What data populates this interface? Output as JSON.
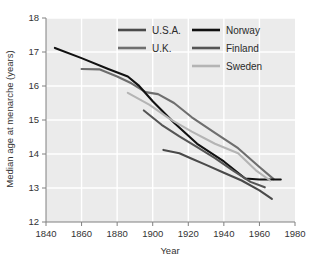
{
  "chart_data": {
    "type": "line",
    "title": "",
    "xlabel": "Year",
    "ylabel": "Median age at menarche (years)",
    "xlim": [
      1840,
      1980
    ],
    "ylim": [
      12,
      18
    ],
    "xticks": [
      1840,
      1860,
      1880,
      1900,
      1920,
      1940,
      1960,
      1980
    ],
    "yticks": [
      12,
      13,
      14,
      15,
      16,
      17,
      18
    ],
    "grid": true,
    "legend_position": "top-right",
    "series": [
      {
        "name": "U.S.A.",
        "color": "#4a4a4a",
        "x": [
          1906,
          1915,
          1922,
          1930,
          1940,
          1950,
          1960,
          1967
        ],
        "y": [
          14.12,
          14.02,
          13.86,
          13.68,
          13.45,
          13.22,
          12.93,
          12.68
        ]
      },
      {
        "name": "U.K.",
        "color": "#6e6e6e",
        "x": [
          1860,
          1870,
          1880,
          1888,
          1896,
          1903,
          1912,
          1922,
          1935,
          1948,
          1960,
          1968
        ],
        "y": [
          16.5,
          16.49,
          16.28,
          16.08,
          15.82,
          15.76,
          15.5,
          15.08,
          14.62,
          14.17,
          13.62,
          13.26
        ]
      },
      {
        "name": "Norway",
        "color": "#111111",
        "x": [
          1845,
          1860,
          1875,
          1886,
          1892,
          1900,
          1912,
          1925,
          1940,
          1952,
          1960,
          1972
        ],
        "y": [
          17.12,
          16.82,
          16.5,
          16.28,
          16.02,
          15.55,
          14.92,
          14.3,
          13.78,
          13.28,
          13.25,
          13.25
        ]
      },
      {
        "name": "Finland",
        "color": "#555555",
        "x": [
          1895,
          1905,
          1915,
          1925,
          1935,
          1945,
          1955,
          1963
        ],
        "y": [
          15.28,
          14.86,
          14.52,
          14.2,
          13.88,
          13.52,
          13.18,
          13.02
        ]
      },
      {
        "name": "Sweden",
        "color": "#b4b4b4",
        "x": [
          1886,
          1898,
          1910,
          1922,
          1935,
          1948,
          1958,
          1966
        ],
        "y": [
          15.8,
          15.45,
          15.02,
          14.66,
          14.3,
          14.02,
          13.52,
          13.22
        ]
      }
    ],
    "legend_entries": [
      {
        "label": "U.S.A.",
        "color": "#4a4a4a",
        "col": 0,
        "row": 0
      },
      {
        "label": "Norway",
        "color": "#111111",
        "col": 1,
        "row": 0
      },
      {
        "label": "U.K.",
        "color": "#6e6e6e",
        "col": 0,
        "row": 1
      },
      {
        "label": "Finland",
        "color": "#555555",
        "col": 1,
        "row": 1
      },
      {
        "label": "Sweden",
        "color": "#b4b4b4",
        "col": 1,
        "row": 2
      }
    ],
    "colors": {
      "plot_background": "#ebebeb",
      "gridline": "#ffffff",
      "axis": "#808080",
      "text": "#333333"
    }
  }
}
